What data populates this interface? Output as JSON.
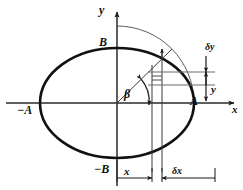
{
  "figure": {
    "kind": "geometry-diagram",
    "background_color": "#ffffff",
    "stroke_color": "#1a1a1a",
    "thin_stroke_color": "#555555",
    "canvas": {
      "width": 243,
      "height": 190
    }
  },
  "axes": {
    "x_label": "x",
    "y_label": "y",
    "origin": {
      "x": 117,
      "y": 103
    }
  },
  "labels": {
    "semi_major_positive": "A",
    "semi_major_negative": "−A",
    "semi_minor_positive": "B",
    "semi_minor_negative": "−B",
    "angle": "β",
    "delta_y": "δy",
    "delta_x": "δx",
    "coord_y": "y",
    "coord_x": "x"
  },
  "geometry": {
    "ellipse": {
      "cx": 117,
      "cy": 103,
      "rx": 77,
      "ry": 55
    },
    "auxiliary_circle": {
      "cx": 117,
      "cy": 103,
      "rx": 77,
      "ry": 77
    },
    "radial_line": {
      "x1": 117,
      "y1": 103,
      "x2": 172,
      "y2": 49
    },
    "strip": {
      "x_left": 152,
      "x_right": 162
    },
    "delta_y_band": {
      "y_top": 72,
      "y_bottom": 85
    },
    "measure_baseline_y": 178,
    "measure_right_x": 215
  }
}
